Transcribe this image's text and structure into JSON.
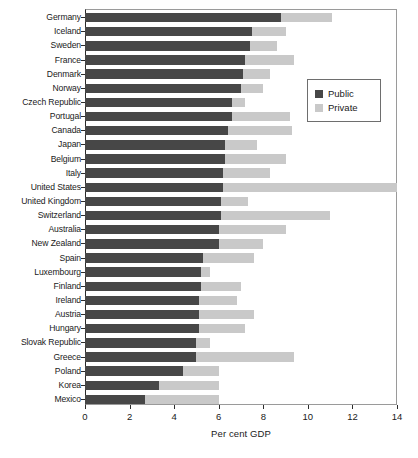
{
  "chart_data": {
    "type": "bar",
    "orientation": "horizontal",
    "stacked": true,
    "title": "",
    "xlabel": "Per cent GDP",
    "ylabel": "",
    "xlim": [
      0,
      14
    ],
    "xticks": [
      0,
      2,
      4,
      6,
      8,
      10,
      12,
      14
    ],
    "xtick_labels": [
      "0",
      "2",
      "4",
      "6",
      "8",
      "10",
      "12",
      "14"
    ],
    "grid": false,
    "legend_position": "upper right",
    "categories": [
      "Germany",
      "Iceland",
      "Sweden",
      "France",
      "Denmark",
      "Norway",
      "Czech Republic",
      "Portugal",
      "Canada",
      "Japan",
      "Belgium",
      "Italy",
      "United States",
      "United Kingdom",
      "Switzerland",
      "Australia",
      "New Zealand",
      "Spain",
      "Luxembourg",
      "Finland",
      "Ireland",
      "Austria",
      "Hungary",
      "Slovak Republic",
      "Greece",
      "Poland",
      "Korea",
      "Mexico"
    ],
    "series": [
      {
        "name": "Public",
        "color": "#474747",
        "values": [
          8.8,
          7.5,
          7.4,
          7.2,
          7.1,
          7.0,
          6.6,
          6.6,
          6.4,
          6.3,
          6.3,
          6.2,
          6.2,
          6.1,
          6.1,
          6.0,
          6.0,
          5.3,
          5.2,
          5.2,
          5.1,
          5.1,
          5.1,
          5.0,
          5.0,
          4.4,
          3.3,
          2.7
        ]
      },
      {
        "name": "Private",
        "color": "#c9c9c9",
        "values": [
          2.3,
          1.5,
          1.2,
          2.2,
          1.2,
          1.0,
          0.6,
          2.6,
          2.9,
          1.4,
          2.7,
          2.1,
          7.8,
          1.2,
          4.9,
          3.0,
          2.0,
          2.3,
          0.4,
          1.8,
          1.7,
          2.5,
          2.1,
          0.6,
          4.4,
          1.6,
          2.7,
          3.3
        ]
      }
    ],
    "totals": [
      11.1,
      9.0,
      8.6,
      9.4,
      8.3,
      8.0,
      7.2,
      9.2,
      9.3,
      7.7,
      9.0,
      8.3,
      14.0,
      7.3,
      11.0,
      9.0,
      8.0,
      7.6,
      5.6,
      7.0,
      6.8,
      7.6,
      7.2,
      5.6,
      9.4,
      6.0,
      6.0,
      6.0
    ]
  },
  "legend": {
    "items": [
      {
        "label": "Public",
        "color": "#474747"
      },
      {
        "label": "Private",
        "color": "#c9c9c9"
      }
    ]
  },
  "axis": {
    "x_title": "Per cent GDP"
  }
}
